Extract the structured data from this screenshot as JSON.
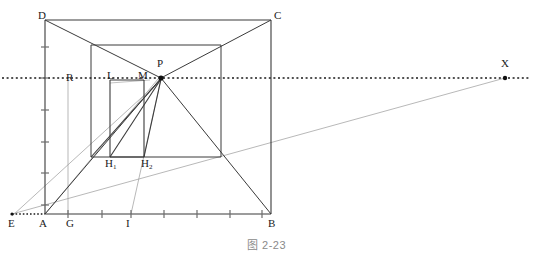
{
  "figure": {
    "caption": "图 2-23"
  },
  "colors": {
    "ink": "#2b2b2b",
    "gray": "#8d8d8d",
    "light_gray": "#b0b0b0",
    "caption": "#8a8a8a",
    "background": "#ffffff"
  },
  "labels": [
    {
      "id": "D",
      "text": "D",
      "x": 38,
      "y": 10
    },
    {
      "id": "C",
      "text": "C",
      "x": 274,
      "y": 10
    },
    {
      "id": "P",
      "text": "P",
      "x": 157,
      "y": 58
    },
    {
      "id": "X",
      "text": "X",
      "x": 501,
      "y": 58
    },
    {
      "id": "R",
      "text": "R",
      "x": 66,
      "y": 72
    },
    {
      "id": "L",
      "text": "L",
      "x": 107,
      "y": 70
    },
    {
      "id": "M",
      "text": "M",
      "x": 138,
      "y": 70
    },
    {
      "id": "H1",
      "text": "H",
      "sub": "1",
      "x": 105,
      "y": 158
    },
    {
      "id": "H2",
      "text": "H",
      "sub": "2",
      "x": 141,
      "y": 158
    },
    {
      "id": "E",
      "text": "E",
      "x": 8,
      "y": 218
    },
    {
      "id": "A",
      "text": "A",
      "x": 39,
      "y": 218
    },
    {
      "id": "G",
      "text": "G",
      "x": 66,
      "y": 218
    },
    {
      "id": "I",
      "text": "I",
      "x": 126,
      "y": 218
    },
    {
      "id": "B",
      "text": "B",
      "x": 268,
      "y": 218
    }
  ],
  "points": {
    "A": {
      "x": 45,
      "y": 214
    },
    "B": {
      "x": 271,
      "y": 214
    },
    "C": {
      "x": 271,
      "y": 20
    },
    "D": {
      "x": 45,
      "y": 20
    },
    "E": {
      "x": 12,
      "y": 214
    },
    "G": {
      "x": 68,
      "y": 214
    },
    "I": {
      "x": 131,
      "y": 214
    },
    "P": {
      "x": 161,
      "y": 78
    },
    "X": {
      "x": 505,
      "y": 78
    },
    "R": {
      "x": 69,
      "y": 78
    },
    "L": {
      "x": 110,
      "y": 80
    },
    "M": {
      "x": 144,
      "y": 79
    },
    "H1": {
      "x": 110,
      "y": 157
    },
    "H2": {
      "x": 144,
      "y": 157
    },
    "inner_tl": {
      "x": 91,
      "y": 45
    },
    "inner_tr": {
      "x": 221,
      "y": 45
    },
    "inner_br": {
      "x": 221,
      "y": 157
    },
    "inner_bl": {
      "x": 91,
      "y": 157
    }
  },
  "geometry": {
    "outer_square": {
      "x": 45,
      "y": 20,
      "w": 226,
      "h": 194
    },
    "inner_square": {
      "x": 91,
      "y": 45,
      "w": 130,
      "h": 112
    },
    "small_rect": {
      "x": 110,
      "y": 80,
      "w": 34,
      "h": 77
    },
    "horizon_y": 78,
    "horizon_x1": 2,
    "horizon_x2": 531
  },
  "ticks": {
    "left_axis_x": 45,
    "left_axis_values": [
      47,
      78,
      110,
      142,
      173,
      205
    ],
    "bottom_axis_y": 214,
    "bottom_axis_values": [
      68,
      102,
      131,
      164,
      197,
      230,
      262
    ]
  },
  "segments": {
    "outline": "A-B-C-D closed outer square",
    "diagonals": [
      "D to P to B",
      "A to P to C"
    ],
    "inner": "inner square edges",
    "guides": [
      "E to X through inner bottom-right",
      "E to R",
      "G vertical",
      "I to P",
      "H1 to P",
      "A to M"
    ]
  }
}
